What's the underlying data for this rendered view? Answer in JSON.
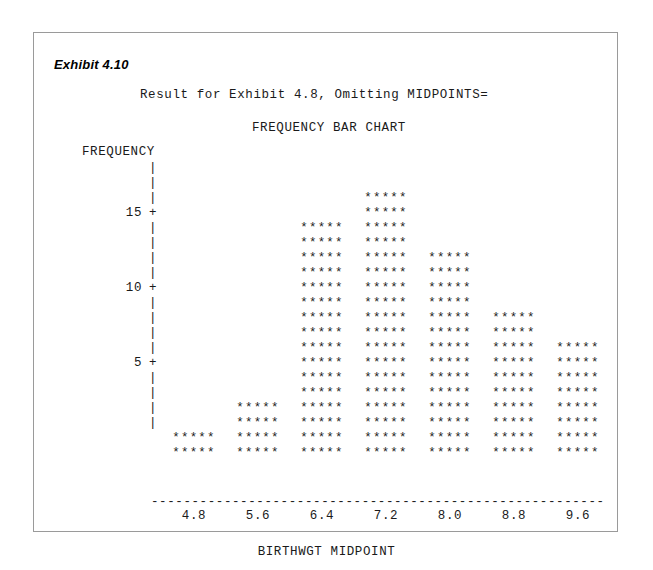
{
  "exhibit": {
    "label": "Exhibit 4.10"
  },
  "report": {
    "title": "Result for Exhibit 4.8, Omitting MIDPOINTS=",
    "chart_title": "FREQUENCY BAR CHART"
  },
  "axes": {
    "y_label": "FREQUENCY",
    "x_label": "BIRTHWGT MIDPOINT",
    "tick_glyph": "+",
    "between_glyph": "|",
    "rule_glyph": "-"
  },
  "bar_glyph": "*****",
  "chart_data": {
    "type": "bar",
    "title": "FREQUENCY BAR CHART",
    "subtitle": "Result for Exhibit 4.8, Omitting MIDPOINTS=",
    "xlabel": "BIRTHWGT MIDPOINT",
    "ylabel": "FREQUENCY",
    "categories": [
      "4.8",
      "5.6",
      "6.4",
      "7.2",
      "8.0",
      "8.8",
      "9.6"
    ],
    "values": [
      2,
      4,
      16,
      18,
      14,
      10,
      8
    ],
    "ylim": [
      0,
      19
    ],
    "y_ticks": [
      5,
      10,
      15
    ],
    "grid": false,
    "legend": "none",
    "style": "ascii-character-bars"
  },
  "y_rows": [
    {
      "label": "",
      "glyph": "|"
    },
    {
      "label": "",
      "glyph": "|"
    },
    {
      "label": "",
      "glyph": "|"
    },
    {
      "label": "15",
      "glyph": "+"
    },
    {
      "label": "",
      "glyph": "|"
    },
    {
      "label": "",
      "glyph": "|"
    },
    {
      "label": "",
      "glyph": "|"
    },
    {
      "label": "",
      "glyph": "|"
    },
    {
      "label": "10",
      "glyph": "+"
    },
    {
      "label": "",
      "glyph": "|"
    },
    {
      "label": "",
      "glyph": "|"
    },
    {
      "label": "",
      "glyph": "|"
    },
    {
      "label": "",
      "glyph": "|"
    },
    {
      "label": "5",
      "glyph": "+"
    },
    {
      "label": "",
      "glyph": "|"
    },
    {
      "label": "",
      "glyph": "|"
    },
    {
      "label": "",
      "glyph": "|"
    },
    {
      "label": "",
      "glyph": "|"
    }
  ],
  "x_axis_rule": "---------------------------------------------------------",
  "x_ticks": [
    "4.8",
    "5.6",
    "6.4",
    "7.2",
    "8.0",
    "8.8",
    "9.6"
  ]
}
